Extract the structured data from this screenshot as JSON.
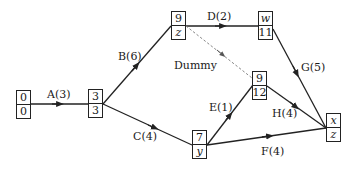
{
  "diagram": {
    "type": "activity-network",
    "colors": {
      "line": "#222222",
      "dummy": "#888888",
      "text": "#1a1a1a"
    },
    "nodes": [
      {
        "id": "n0",
        "top": "0",
        "bottom": "0",
        "top_italic": false,
        "bottom_italic": false
      },
      {
        "id": "n3",
        "top": "3",
        "bottom": "3",
        "top_italic": false,
        "bottom_italic": false
      },
      {
        "id": "n9z",
        "top": "9",
        "bottom": "z",
        "top_italic": false,
        "bottom_italic": true
      },
      {
        "id": "nw",
        "top": "w",
        "bottom": "11",
        "top_italic": true,
        "bottom_italic": false
      },
      {
        "id": "n912",
        "top": "9",
        "bottom": "12",
        "top_italic": false,
        "bottom_italic": false
      },
      {
        "id": "n7y",
        "top": "7",
        "bottom": "y",
        "top_italic": false,
        "bottom_italic": true
      },
      {
        "id": "nxz",
        "top": "x",
        "bottom": "z",
        "top_italic": true,
        "bottom_italic": true
      }
    ],
    "activities": [
      {
        "id": "A",
        "label": "A(3)",
        "from": "n0",
        "to": "n3"
      },
      {
        "id": "B",
        "label": "B(6)",
        "from": "n3",
        "to": "n9z"
      },
      {
        "id": "C",
        "label": "C(4)",
        "from": "n3",
        "to": "n7y"
      },
      {
        "id": "D",
        "label": "D(2)",
        "from": "n9z",
        "to": "nw"
      },
      {
        "id": "Dummy",
        "label": "Dummy",
        "from": "n9z",
        "to": "n912",
        "dashed": true
      },
      {
        "id": "E",
        "label": "E(1)",
        "from": "n7y",
        "to": "n912"
      },
      {
        "id": "F",
        "label": "F(4)",
        "from": "n7y",
        "to": "nxz"
      },
      {
        "id": "G",
        "label": "G(5)",
        "from": "nw",
        "to": "nxz"
      },
      {
        "id": "H",
        "label": "H(4)",
        "from": "n912",
        "to": "nxz"
      }
    ]
  }
}
